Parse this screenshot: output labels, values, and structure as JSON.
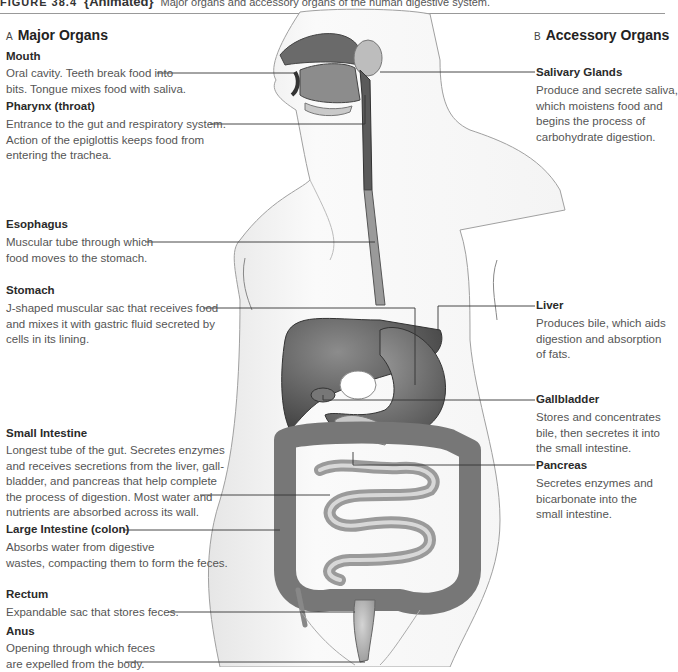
{
  "caption": {
    "figure_number": "FIGURE 38.4",
    "animated_tag": "{Animated}",
    "text": "Major organs and accessory organs of the human digestive system."
  },
  "sections": {
    "major": {
      "letter": "A",
      "title": "Major Organs"
    },
    "accessory": {
      "letter": "B",
      "title": "Accessory Organs"
    }
  },
  "major_organs": [
    {
      "name": "Mouth",
      "lines": [
        "Oral cavity. Teeth break food into",
        "bits. Tongue mixes food with saliva."
      ]
    },
    {
      "name": "Pharynx (throat)",
      "lines": [
        "Entrance to the gut and respiratory system.",
        "Action of the epiglottis keeps food from",
        "entering the trachea."
      ]
    },
    {
      "name": "Esophagus",
      "lines": [
        "Muscular tube through which",
        "food moves to the stomach."
      ]
    },
    {
      "name": "Stomach",
      "lines": [
        "J-shaped muscular sac that receives food",
        "and mixes it with gastric fluid secreted by",
        "cells in its lining."
      ]
    },
    {
      "name": "Small Intestine",
      "lines": [
        "Longest tube of the gut. Secretes enzymes",
        "and receives secretions from the liver, gall-",
        "bladder, and pancreas that help complete",
        "the process of digestion. Most water and",
        "nutrients are absorbed across its wall."
      ]
    },
    {
      "name": "Large Intestine (colon)",
      "lines": [
        "Absorbs water from digestive",
        "wastes, compacting them to form the feces."
      ]
    },
    {
      "name": "Rectum",
      "lines": [
        "Expandable sac that stores feces."
      ]
    },
    {
      "name": "Anus",
      "lines": [
        "Opening through which feces",
        "are expelled from the body."
      ]
    }
  ],
  "accessory_organs": [
    {
      "name": "Salivary Glands",
      "lines": [
        "Produce and secrete saliva,",
        "which moistens food and",
        "begins the process of",
        "carbohydrate digestion."
      ]
    },
    {
      "name": "Liver",
      "lines": [
        "Produces bile, which aids",
        "digestion and absorption",
        "of fats."
      ]
    },
    {
      "name": "Gallbladder",
      "lines": [
        "Stores and concentrates",
        "bile, then secretes it into",
        "the small intestine."
      ]
    },
    {
      "name": "Pancreas",
      "lines": [
        "Secretes enzymes and",
        "bicarbonate into the",
        "small intestine."
      ]
    }
  ],
  "colors": {
    "organ_dark": "#5a5a5a",
    "organ_mid": "#8a8a8a",
    "organ_light": "#c4c4c4",
    "body_outline": "#9a9a9a",
    "leader_line": "#333333"
  }
}
